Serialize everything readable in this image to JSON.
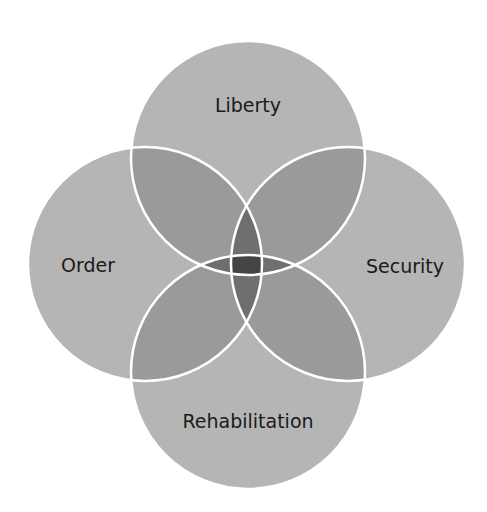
{
  "diagram": {
    "type": "venn-4-circles",
    "colors": {
      "fill": "#b5b5b5",
      "overlap": "#9a9a9a",
      "stroke": "#ffffff",
      "text": "#1a1a1a"
    },
    "circles": [
      {
        "id": "liberty",
        "label": "Liberty",
        "cx": 248,
        "cy": 158,
        "r": 117
      },
      {
        "id": "order",
        "label": "Order",
        "cx": 145,
        "cy": 264,
        "r": 117
      },
      {
        "id": "security",
        "label": "Security",
        "cx": 348,
        "cy": 264,
        "r": 117
      },
      {
        "id": "rehabilitation",
        "label": "Rehabilitation",
        "cx": 248,
        "cy": 372,
        "r": 117
      }
    ]
  }
}
